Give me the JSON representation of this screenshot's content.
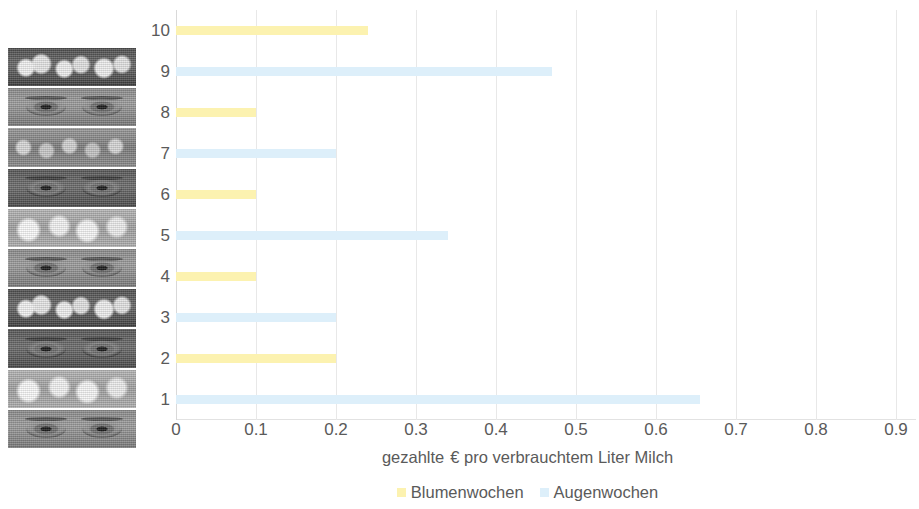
{
  "chart_data": {
    "type": "bar",
    "orientation": "horizontal",
    "title": "",
    "xlabel": "gezahlte  € pro verbrauchtem Liter Milch",
    "ylabel": "",
    "categories": [
      "10",
      "9",
      "8",
      "7",
      "6",
      "5",
      "4",
      "3",
      "2",
      "1"
    ],
    "xlim": [
      0,
      0.925
    ],
    "xticks": [
      0,
      0.1,
      0.2,
      0.3,
      0.4,
      0.5,
      0.6,
      0.7,
      0.8,
      0.9,
      1
    ],
    "xtick_labels": [
      "0",
      "0.1",
      "0.2",
      "0.3",
      "0.4",
      "0.5",
      "0.6",
      "0.7",
      "0.8",
      "0.9",
      "1"
    ],
    "grid": true,
    "grid_axis": "x",
    "legend_position": "bottom",
    "series": [
      {
        "name": "Blumenwochen",
        "color": "#fcf2b0",
        "values": [
          0.24,
          null,
          0.1,
          null,
          0.1,
          null,
          0.1,
          null,
          0.2,
          null
        ]
      },
      {
        "name": "Augenwochen",
        "color": "#ddeffa",
        "values": [
          null,
          0.47,
          null,
          0.2,
          null,
          0.34,
          null,
          0.2,
          null,
          0.655
        ]
      }
    ],
    "bars": [
      {
        "category": "10",
        "series": "Blumenwochen",
        "value": 0.24
      },
      {
        "category": "9",
        "series": "Augenwochen",
        "value": 0.47
      },
      {
        "category": "8",
        "series": "Blumenwochen",
        "value": 0.1
      },
      {
        "category": "7",
        "series": "Augenwochen",
        "value": 0.2
      },
      {
        "category": "6",
        "series": "Blumenwochen",
        "value": 0.1
      },
      {
        "category": "5",
        "series": "Augenwochen",
        "value": 0.34
      },
      {
        "category": "4",
        "series": "Blumenwochen",
        "value": 0.1
      },
      {
        "category": "3",
        "series": "Augenwochen",
        "value": 0.2
      },
      {
        "category": "2",
        "series": "Blumenwochen",
        "value": 0.2
      },
      {
        "category": "1",
        "series": "Augenwochen",
        "value": 0.655
      }
    ]
  },
  "legend": {
    "items": [
      {
        "label": "Blumenwochen",
        "color": "#fcf2b0"
      },
      {
        "label": "Augenwochen",
        "color": "#ddeffa"
      }
    ]
  },
  "axis": {
    "x_title_part1": "gezahlte",
    "x_title_part2": "€ pro verbrauchtem Liter Milch"
  },
  "photo_strip": {
    "bands": [
      {
        "kind": "flowers",
        "row": "10"
      },
      {
        "kind": "eyes",
        "row": "9"
      },
      {
        "kind": "flowers",
        "row": "8"
      },
      {
        "kind": "eyes",
        "row": "7"
      },
      {
        "kind": "flowers",
        "row": "6"
      },
      {
        "kind": "eyes",
        "row": "5"
      },
      {
        "kind": "flowers",
        "row": "4"
      },
      {
        "kind": "eyes",
        "row": "3"
      },
      {
        "kind": "flowers",
        "row": "2"
      },
      {
        "kind": "eyes",
        "row": "1"
      }
    ]
  }
}
